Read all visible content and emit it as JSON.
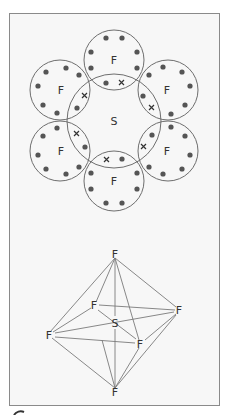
{
  "figure": {
    "dot_cross": {
      "central_atom": "S",
      "outer_atoms": [
        "F",
        "F",
        "F",
        "F",
        "F",
        "F"
      ],
      "nonbonding_dots_per_F": 6,
      "bond_pair_markers": [
        "•",
        "×"
      ],
      "colors": {
        "line": "#6e6e6e",
        "dot": "#555555",
        "cross": "#333333",
        "text": "#333333"
      }
    },
    "octahedron": {
      "central_atom": "S",
      "vertices": {
        "top": "F",
        "back_left": "F",
        "right": "F",
        "left": "F",
        "front": "F",
        "bottom": "F"
      }
    },
    "colors": {
      "frame_bg": "#f7f7f7",
      "frame_border": "#8a8a8a",
      "page_bg": "#ffffff"
    }
  }
}
